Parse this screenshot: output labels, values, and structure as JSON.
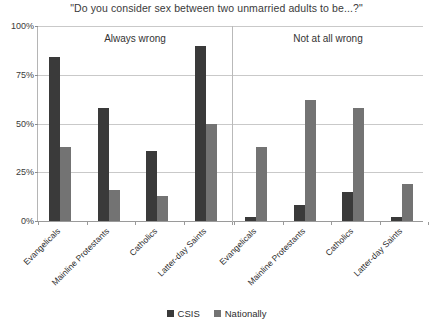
{
  "chart_data": {
    "type": "bar",
    "title": "\"Do you consider sex between two unmarried adults to be...?\"",
    "xlabel": "",
    "ylabel": "",
    "ylim": [
      0,
      100
    ],
    "grid": true,
    "legend_position": "bottom",
    "y_ticks": [
      "0%",
      "25%",
      "50%",
      "75%",
      "100%"
    ],
    "y_tick_values": [
      0,
      25,
      50,
      75,
      100
    ],
    "panels": [
      {
        "caption": "Always wrong",
        "categories": [
          "Evangelicals",
          "Mainline Protestants",
          "Catholics",
          "Latter-day Saints"
        ],
        "series": [
          {
            "name": "CSIS",
            "color": "#3a3a3a",
            "values": [
              84,
              58,
              36,
              90
            ]
          },
          {
            "name": "Nationally",
            "color": "#737373",
            "values": [
              38,
              16,
              13,
              50
            ]
          }
        ]
      },
      {
        "caption": "Not at all wrong",
        "categories": [
          "Evangelicals",
          "Mainline Protestants",
          "Catholics",
          "Latter-day Saints"
        ],
        "series": [
          {
            "name": "CSIS",
            "color": "#3a3a3a",
            "values": [
              2,
              8,
              15,
              2
            ]
          },
          {
            "name": "Nationally",
            "color": "#737373",
            "values": [
              38,
              62,
              58,
              19
            ]
          }
        ]
      }
    ],
    "legend": [
      {
        "label": "CSIS",
        "color": "#3a3a3a"
      },
      {
        "label": "Nationally",
        "color": "#737373"
      }
    ]
  }
}
